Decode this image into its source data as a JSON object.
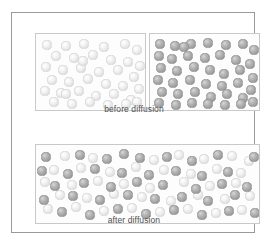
{
  "figure": {
    "title_alt": "Diffusion of two gases before and after mixing",
    "colors": {
      "outer_frame": "#9a9a9a",
      "panel_border": "#c9c9c9",
      "panel_fill": "#fdfdfd",
      "caption_text": "#4f4f4f",
      "light_particle": "#e7e7e7",
      "dark_particle": "#a6a6a6",
      "page_background": "#ffffff"
    }
  },
  "captions": {
    "before": "before diffusion",
    "after": "after diffusion"
  },
  "panels": [
    {
      "id": "before-left",
      "name": "before-diffusion-left-container",
      "particle_type": "light",
      "particle_count": 38
    },
    {
      "id": "before-right",
      "name": "before-diffusion-right-container",
      "particle_type": "dark",
      "particle_count": 42
    },
    {
      "id": "after",
      "name": "after-diffusion-container",
      "particle_type": "mixed",
      "particle_count": 82
    }
  ],
  "chart_data": {
    "type": "scatter",
    "annotations": [
      "before diffusion",
      "after diffusion"
    ],
    "series": [
      {
        "name": "light-gas-particles-before",
        "panel": "before-left",
        "r": 4.6,
        "points": [
          [
            11,
            11
          ],
          [
            30,
            12
          ],
          [
            48,
            10
          ],
          [
            68,
            13
          ],
          [
            89,
            10
          ],
          [
            101,
            16
          ],
          [
            20,
            22
          ],
          [
            38,
            24
          ],
          [
            57,
            21
          ],
          [
            75,
            26
          ],
          [
            92,
            28
          ],
          [
            104,
            32
          ],
          [
            10,
            33
          ],
          [
            27,
            36
          ],
          [
            45,
            34
          ],
          [
            63,
            38
          ],
          [
            82,
            36
          ],
          [
            98,
            43
          ],
          [
            16,
            46
          ],
          [
            33,
            48
          ],
          [
            52,
            45
          ],
          [
            70,
            50
          ],
          [
            87,
            52
          ],
          [
            103,
            55
          ],
          [
            9,
            57
          ],
          [
            25,
            59
          ],
          [
            43,
            57
          ],
          [
            60,
            62
          ],
          [
            78,
            60
          ],
          [
            95,
            66
          ],
          [
            18,
            68
          ],
          [
            36,
            70
          ],
          [
            54,
            68
          ],
          [
            72,
            71
          ],
          [
            90,
            70
          ],
          [
            30,
            60
          ],
          [
            101,
            68
          ],
          [
            47,
            27
          ]
        ]
      },
      {
        "name": "dark-gas-particles-before",
        "panel": "before-right",
        "r": 4.6,
        "points": [
          [
            10,
            10
          ],
          [
            25,
            12
          ],
          [
            41,
            10
          ],
          [
            58,
            9
          ],
          [
            76,
            11
          ],
          [
            93,
            10
          ],
          [
            104,
            16
          ],
          [
            9,
            22
          ],
          [
            22,
            25
          ],
          [
            38,
            22
          ],
          [
            55,
            24
          ],
          [
            70,
            21
          ],
          [
            86,
            26
          ],
          [
            100,
            30
          ],
          [
            11,
            34
          ],
          [
            27,
            37
          ],
          [
            44,
            33
          ],
          [
            60,
            36
          ],
          [
            74,
            40
          ],
          [
            90,
            36
          ],
          [
            103,
            44
          ],
          [
            8,
            46
          ],
          [
            23,
            49
          ],
          [
            40,
            46
          ],
          [
            56,
            50
          ],
          [
            72,
            52
          ],
          [
            88,
            49
          ],
          [
            101,
            56
          ],
          [
            12,
            58
          ],
          [
            28,
            60
          ],
          [
            45,
            58
          ],
          [
            61,
            63
          ],
          [
            77,
            60
          ],
          [
            93,
            64
          ],
          [
            9,
            69
          ],
          [
            26,
            71
          ],
          [
            42,
            69
          ],
          [
            58,
            70
          ],
          [
            75,
            71
          ],
          [
            91,
            70
          ],
          [
            103,
            68
          ],
          [
            34,
            13
          ]
        ]
      },
      {
        "name": "mixed-particles-after",
        "panel": "after",
        "r": 4.6,
        "points_light": [
          [
            29,
            11
          ],
          [
            57,
            13
          ],
          [
            118,
            15
          ],
          [
            143,
            10
          ],
          [
            168,
            14
          ],
          [
            196,
            11
          ],
          [
            213,
            16
          ],
          [
            18,
            25
          ],
          [
            45,
            23
          ],
          [
            74,
            27
          ],
          [
            100,
            22
          ],
          [
            128,
            25
          ],
          [
            155,
            29
          ],
          [
            181,
            24
          ],
          [
            205,
            28
          ],
          [
            9,
            37
          ],
          [
            36,
            40
          ],
          [
            62,
            36
          ],
          [
            88,
            39
          ],
          [
            114,
            43
          ],
          [
            148,
            37
          ],
          [
            174,
            41
          ],
          [
            200,
            38
          ],
          [
            24,
            50
          ],
          [
            51,
            53
          ],
          [
            78,
            49
          ],
          [
            106,
            52
          ],
          [
            135,
            56
          ],
          [
            162,
            50
          ],
          [
            189,
            54
          ],
          [
            214,
            51
          ],
          [
            12,
            64
          ],
          [
            40,
            62
          ],
          [
            68,
            66
          ],
          [
            96,
            63
          ],
          [
            124,
            67
          ],
          [
            152,
            64
          ],
          [
            180,
            68
          ],
          [
            206,
            65
          ]
        ],
        "points_dark": [
          [
            10,
            12
          ],
          [
            44,
            10
          ],
          [
            71,
            14
          ],
          [
            88,
            9
          ],
          [
            104,
            13
          ],
          [
            131,
            12
          ],
          [
            156,
            16
          ],
          [
            182,
            10
          ],
          [
            218,
            12
          ],
          [
            6,
            26
          ],
          [
            32,
            29
          ],
          [
            59,
            24
          ],
          [
            86,
            28
          ],
          [
            113,
            30
          ],
          [
            140,
            26
          ],
          [
            166,
            31
          ],
          [
            192,
            27
          ],
          [
            19,
            41
          ],
          [
            48,
            38
          ],
          [
            75,
            42
          ],
          [
            101,
            37
          ],
          [
            127,
            40
          ],
          [
            160,
            44
          ],
          [
            186,
            39
          ],
          [
            211,
            42
          ],
          [
            8,
            55
          ],
          [
            37,
            51
          ],
          [
            64,
            55
          ],
          [
            92,
            50
          ],
          [
            119,
            54
          ],
          [
            146,
            52
          ],
          [
            172,
            56
          ],
          [
            199,
            50
          ],
          [
            26,
            67
          ],
          [
            54,
            70
          ],
          [
            82,
            64
          ],
          [
            110,
            69
          ],
          [
            138,
            65
          ],
          [
            166,
            70
          ],
          [
            193,
            66
          ],
          [
            219,
            68
          ]
        ]
      }
    ],
    "legend_position": "none",
    "grid": false
  }
}
